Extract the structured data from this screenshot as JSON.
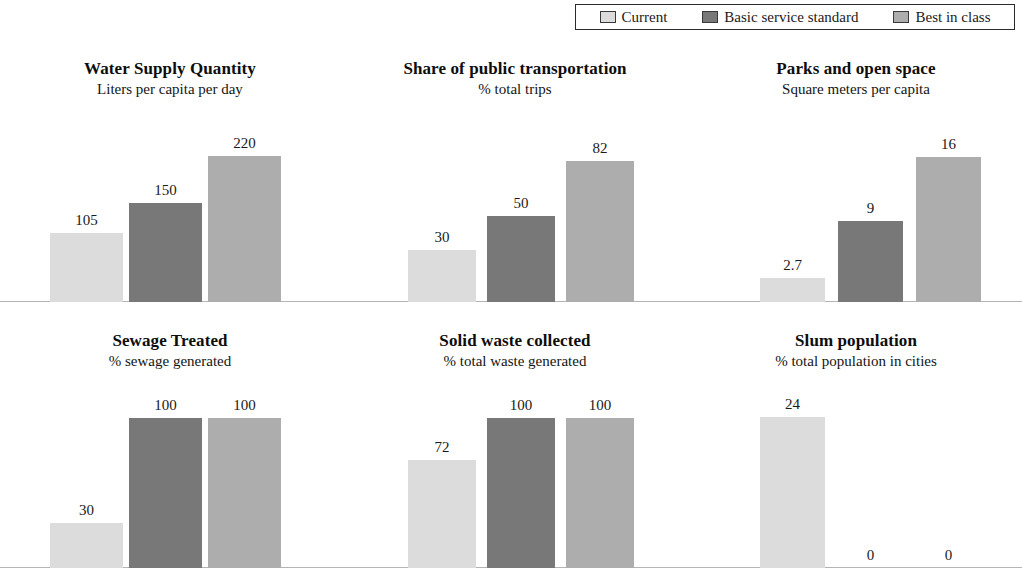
{
  "legend": {
    "entries": [
      {
        "label": "Current",
        "color": "#dcdcdc"
      },
      {
        "label": "Basic service standard",
        "color": "#787878"
      },
      {
        "label": "Best in class",
        "color": "#adadad"
      }
    ]
  },
  "chart_data": {
    "type": "bar",
    "title": "",
    "series_names": [
      "Current",
      "Basic service standard",
      "Best in class"
    ],
    "series_colors": [
      "#dcdcdc",
      "#787878",
      "#adadad"
    ],
    "grid": false,
    "legend_position": "top-right",
    "panels": [
      {
        "title": "Water Supply Quantity",
        "subtitle": "Liters per capita per day",
        "ylabel": "Liters per capita per day",
        "categories": [
          "Current",
          "Basic service standard",
          "Best in class"
        ],
        "values": [
          105,
          150,
          220
        ],
        "labels": [
          "105",
          "150",
          "220"
        ],
        "ylim": [
          0,
          260
        ]
      },
      {
        "title": "Share of public transportation",
        "subtitle": "% total trips",
        "ylabel": "% total trips",
        "categories": [
          "Current",
          "Basic service standard",
          "Best in class"
        ],
        "values": [
          30,
          50,
          82
        ],
        "labels": [
          "30",
          "50",
          "82"
        ],
        "ylim": [
          0,
          100
        ]
      },
      {
        "title": "Parks and open space",
        "subtitle": "Square meters per capita",
        "ylabel": "Square meters per capita",
        "categories": [
          "Current",
          "Basic service standard",
          "Best in class"
        ],
        "values": [
          2.7,
          9,
          16
        ],
        "labels": [
          "2.7",
          "9",
          "16"
        ],
        "ylim": [
          0,
          19
        ]
      },
      {
        "title": "Sewage Treated",
        "subtitle": "% sewage generated",
        "ylabel": "% sewage generated",
        "categories": [
          "Current",
          "Basic service standard",
          "Best in class"
        ],
        "values": [
          30,
          100,
          100
        ],
        "labels": [
          "30",
          "100",
          "100"
        ],
        "ylim": [
          0,
          113
        ]
      },
      {
        "title": "Solid waste collected",
        "subtitle": "% total waste generated",
        "ylabel": "% total waste generated",
        "categories": [
          "Current",
          "Basic service standard",
          "Best in class"
        ],
        "values": [
          72,
          100,
          100
        ],
        "labels": [
          "72",
          "100",
          "100"
        ],
        "ylim": [
          0,
          113
        ]
      },
      {
        "title": "Slum population",
        "subtitle": "% total population in cities",
        "ylabel": "% total population in cities",
        "categories": [
          "Current",
          "Basic service standard",
          "Best in class"
        ],
        "values": [
          24,
          0,
          0
        ],
        "labels": [
          "24",
          "0",
          "0"
        ],
        "ylim": [
          0,
          27
        ]
      }
    ]
  },
  "layout": {
    "panel_boxes": [
      {
        "left": 0,
        "top": 58,
        "width": 340,
        "plot_top": 130,
        "plot_height": 172,
        "bar_width": 73,
        "bar_gap": 6,
        "bars_left": 50
      },
      {
        "left": 340,
        "top": 58,
        "width": 350,
        "plot_top": 130,
        "plot_height": 172,
        "bar_width": 68,
        "bar_gap": 11,
        "bars_left": 68
      },
      {
        "left": 690,
        "top": 58,
        "width": 332,
        "plot_top": 130,
        "plot_height": 172,
        "bar_width": 65,
        "bar_gap": 13,
        "bars_left": 70
      },
      {
        "left": 0,
        "top": 330,
        "width": 340,
        "plot_top": 398,
        "plot_height": 170,
        "bar_width": 73,
        "bar_gap": 6,
        "bars_left": 50
      },
      {
        "left": 340,
        "top": 330,
        "width": 350,
        "plot_top": 398,
        "plot_height": 170,
        "bar_width": 68,
        "bar_gap": 11,
        "bars_left": 68
      },
      {
        "left": 690,
        "top": 330,
        "width": 332,
        "plot_top": 398,
        "plot_height": 170,
        "bar_width": 65,
        "bar_gap": 13,
        "bars_left": 70
      }
    ]
  }
}
